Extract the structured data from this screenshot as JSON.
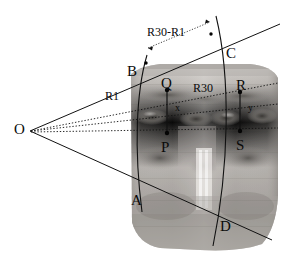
{
  "figure": {
    "type": "geometry-diagram",
    "background_color": "#ffffff",
    "ink_color": "#111111"
  },
  "vertex": {
    "label": "O",
    "x": 30,
    "y": 131
  },
  "points": [
    {
      "label": "B",
      "lx": 127,
      "ly": 72,
      "dot_x": 146,
      "dot_y": 63,
      "on": "arc-inner"
    },
    {
      "label": "C",
      "lx": 226,
      "ly": 55,
      "dot_x": 211,
      "dot_y": 34,
      "on": "arc-outer"
    },
    {
      "label": "Q",
      "lx": 163,
      "ly": 87,
      "dot_x": 167,
      "dot_y": 90,
      "on": "arc-inner"
    },
    {
      "label": "R",
      "lx": 238,
      "ly": 89,
      "dot_x": 240,
      "dot_y": 92,
      "on": "arc-outer"
    },
    {
      "label": "P",
      "lx": 163,
      "ly": 160,
      "dot_x": 167,
      "dot_y": 133,
      "on": "arc-inner"
    },
    {
      "label": "S",
      "lx": 238,
      "ly": 158,
      "dot_x": 240,
      "dot_y": 131,
      "on": "arc-outer"
    },
    {
      "label": "A",
      "lx": 133,
      "ly": 209,
      "dot_x": 146,
      "dot_y": 200,
      "on": "arc-inner"
    },
    {
      "label": "D",
      "lx": 222,
      "ly": 235,
      "dot_x": 217,
      "dot_y": 226,
      "on": "arc-outer"
    }
  ],
  "measures": [
    {
      "label": "R30-R1",
      "lx": 148,
      "ly": 33,
      "kind": "span-between-arcs"
    },
    {
      "label": "R1",
      "lx": 108,
      "ly": 97,
      "kind": "radius-inner"
    },
    {
      "label": "R30",
      "lx": 196,
      "ly": 89,
      "kind": "radius-outer"
    },
    {
      "label": "x",
      "lx": 177,
      "ly": 108,
      "kind": "segment-QP"
    },
    {
      "label": "y",
      "lx": 250,
      "ly": 108,
      "kind": "segment-RS"
    }
  ],
  "segments": [
    {
      "name": "segment-QP",
      "from": "Q",
      "to": "P",
      "x": 167,
      "y1": 90,
      "y2": 133
    },
    {
      "name": "segment-RS",
      "from": "R",
      "to": "S",
      "x": 240,
      "y1": 92,
      "y2": 131
    }
  ],
  "rays": [
    {
      "name": "upper-bound-ray",
      "style": "solid",
      "through": [
        "O",
        "B",
        "C"
      ]
    },
    {
      "name": "lower-bound-ray",
      "style": "solid",
      "through": [
        "O",
        "A",
        "D"
      ]
    },
    {
      "name": "upper-dotted-ray",
      "style": "dotted",
      "through": [
        "O",
        "Q",
        "R"
      ]
    },
    {
      "name": "mid-dotted-ray",
      "style": "dotted",
      "through": [
        "O"
      ]
    },
    {
      "name": "lower-dotted-ray",
      "style": "dotted",
      "through": [
        "O",
        "P",
        "S"
      ]
    }
  ],
  "arcs": [
    {
      "name": "arc-inner",
      "label": "R1",
      "through": [
        "B",
        "Q",
        "P",
        "A"
      ]
    },
    {
      "name": "arc-outer",
      "label": "R30",
      "through": [
        "C",
        "R",
        "S",
        "D"
      ]
    }
  ],
  "image": {
    "name": "face-panorama",
    "alt": "grayscale unwrapped face texture"
  }
}
